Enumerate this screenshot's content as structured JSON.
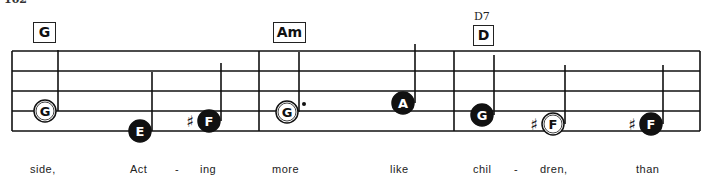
{
  "page": {
    "number": "102"
  },
  "chords": [
    {
      "label": "G",
      "x": 33,
      "y": 22,
      "w": 21
    },
    {
      "label": "Am",
      "x": 273,
      "y": 22,
      "w": 31
    },
    {
      "label": "D",
      "alt": "D7",
      "x": 473,
      "y": 25,
      "w": 19
    }
  ],
  "notes": [
    {
      "letter": "G",
      "filled": false,
      "sharp": false,
      "dot": false,
      "cx": 45,
      "cy": 111,
      "stem_x": 58,
      "stem_top": 50
    },
    {
      "letter": "E",
      "filled": true,
      "sharp": false,
      "dot": false,
      "cx": 140,
      "cy": 131,
      "stem_x": 152,
      "stem_top": 72
    },
    {
      "letter": "F",
      "filled": true,
      "sharp": true,
      "dot": false,
      "cx": 209,
      "cy": 121,
      "stem_x": 221,
      "stem_top": 63
    },
    {
      "letter": "G",
      "filled": false,
      "sharp": false,
      "dot": true,
      "cx": 287,
      "cy": 112,
      "stem_x": 299,
      "stem_top": 52
    },
    {
      "letter": "A",
      "filled": true,
      "sharp": false,
      "dot": false,
      "cx": 403,
      "cy": 103,
      "stem_x": 415,
      "stem_top": 44
    },
    {
      "letter": "G",
      "filled": true,
      "sharp": false,
      "dot": false,
      "cx": 482,
      "cy": 115,
      "stem_x": 494,
      "stem_top": 55
    },
    {
      "letter": "F",
      "filled": false,
      "sharp": true,
      "dot": false,
      "cx": 553,
      "cy": 124,
      "stem_x": 565,
      "stem_top": 65
    },
    {
      "letter": "F",
      "filled": true,
      "sharp": true,
      "dot": false,
      "cx": 651,
      "cy": 124,
      "stem_x": 663,
      "stem_top": 65
    }
  ],
  "lyrics": [
    {
      "text": "side,",
      "x": 30
    },
    {
      "text": "Act",
      "x": 130
    },
    {
      "text": "-",
      "x": 175
    },
    {
      "text": "ing",
      "x": 200
    },
    {
      "text": "more",
      "x": 272
    },
    {
      "text": "like",
      "x": 390
    },
    {
      "text": "chil",
      "x": 473
    },
    {
      "text": "-",
      "x": 514
    },
    {
      "text": "dren,",
      "x": 540
    },
    {
      "text": "than",
      "x": 636
    }
  ],
  "staff": {
    "left": 12,
    "right": 700,
    "lines_y": [
      51,
      71,
      91,
      111,
      131
    ],
    "barlines_x": [
      12,
      259,
      454,
      700
    ]
  },
  "colors": {
    "ink": "#111111",
    "paper": "#ffffff"
  }
}
